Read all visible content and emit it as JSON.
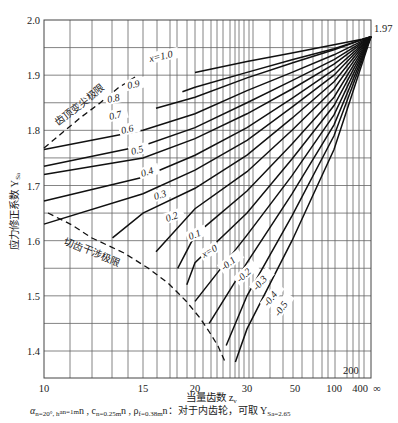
{
  "chart_data": {
    "type": "line",
    "title": "",
    "xlabel": "当量齿数 z_v",
    "ylabel": "应力修正系数 Y_Sa",
    "ylim": [
      1.35,
      2.0
    ],
    "x_scale": "nonlinear (≈1/z), ends at ∞",
    "x_ticks": [
      "10",
      "15",
      "20",
      "30",
      "50",
      "100",
      "400",
      "∞"
    ],
    "x_tick_extra": "200",
    "y_ticks": [
      "1.4",
      "1.5",
      "1.6",
      "1.7",
      "1.8",
      "1.9",
      "2.0"
    ],
    "grid": true,
    "convergence_point": {
      "x": "∞",
      "y": 1.97,
      "label": "1.97"
    },
    "series_param": "x (modification coefficient)",
    "series": [
      {
        "name": "x=1.0",
        "points": [
          [
            20,
            1.905
          ],
          [
            30,
            1.925
          ],
          [
            50,
            1.94
          ],
          [
            100,
            1.955
          ],
          [
            400,
            1.965
          ],
          [
            "∞",
            1.97
          ]
        ]
      },
      {
        "name": "0.9",
        "points": [
          [
            18.5,
            1.87
          ],
          [
            20,
            1.878
          ],
          [
            30,
            1.905
          ],
          [
            50,
            1.928
          ],
          [
            100,
            1.948
          ],
          [
            "∞",
            1.97
          ]
        ]
      },
      {
        "name": "0.8",
        "points": [
          [
            16,
            1.84
          ],
          [
            20,
            1.86
          ],
          [
            30,
            1.895
          ],
          [
            50,
            1.922
          ],
          [
            100,
            1.946
          ],
          [
            "∞",
            1.97
          ]
        ]
      },
      {
        "name": "0.7",
        "points": [
          [
            10,
            1.765
          ],
          [
            15,
            1.8
          ],
          [
            20,
            1.83
          ],
          [
            30,
            1.872
          ],
          [
            50,
            1.905
          ],
          [
            100,
            1.937
          ],
          [
            "∞",
            1.97
          ]
        ]
      },
      {
        "name": "0.6",
        "points": [
          [
            10,
            1.735
          ],
          [
            15,
            1.772
          ],
          [
            20,
            1.805
          ],
          [
            30,
            1.85
          ],
          [
            50,
            1.89
          ],
          [
            100,
            1.928
          ],
          [
            "∞",
            1.97
          ]
        ]
      },
      {
        "name": "0.5",
        "points": [
          [
            10,
            1.72
          ],
          [
            15,
            1.75
          ],
          [
            20,
            1.785
          ],
          [
            30,
            1.83
          ],
          [
            50,
            1.875
          ],
          [
            100,
            1.92
          ],
          [
            "∞",
            1.97
          ]
        ]
      },
      {
        "name": "0.4",
        "points": [
          [
            10,
            1.672
          ],
          [
            15,
            1.715
          ],
          [
            20,
            1.755
          ],
          [
            30,
            1.805
          ],
          [
            50,
            1.858
          ],
          [
            100,
            1.91
          ],
          [
            "∞",
            1.97
          ]
        ]
      },
      {
        "name": "0.3",
        "points": [
          [
            10,
            1.63
          ],
          [
            15,
            1.685
          ],
          [
            20,
            1.728
          ],
          [
            30,
            1.782
          ],
          [
            50,
            1.842
          ],
          [
            100,
            1.9
          ],
          [
            "∞",
            1.97
          ]
        ]
      },
      {
        "name": "0.2",
        "points": [
          [
            13,
            1.605
          ],
          [
            15,
            1.65
          ],
          [
            20,
            1.695
          ],
          [
            30,
            1.755
          ],
          [
            50,
            1.822
          ],
          [
            100,
            1.888
          ],
          [
            "∞",
            1.97
          ]
        ]
      },
      {
        "name": "0.1",
        "points": [
          [
            16,
            1.58
          ],
          [
            20,
            1.658
          ],
          [
            30,
            1.725
          ],
          [
            50,
            1.8
          ],
          [
            100,
            1.875
          ],
          [
            "∞",
            1.97
          ]
        ]
      },
      {
        "name": "x=0",
        "points": [
          [
            18,
            1.55
          ],
          [
            20,
            1.61
          ],
          [
            30,
            1.69
          ],
          [
            50,
            1.775
          ],
          [
            100,
            1.86
          ],
          [
            "∞",
            1.97
          ]
        ]
      },
      {
        "name": "-0.1",
        "points": [
          [
            19,
            1.52
          ],
          [
            20,
            1.56
          ],
          [
            30,
            1.65
          ],
          [
            50,
            1.748
          ],
          [
            100,
            1.845
          ],
          [
            "∞",
            1.97
          ]
        ]
      },
      {
        "name": "-0.2",
        "points": [
          [
            20,
            1.49
          ],
          [
            30,
            1.61
          ],
          [
            50,
            1.718
          ],
          [
            100,
            1.828
          ],
          [
            "∞",
            1.97
          ]
        ]
      },
      {
        "name": "-0.3",
        "points": [
          [
            22,
            1.45
          ],
          [
            30,
            1.56
          ],
          [
            50,
            1.685
          ],
          [
            100,
            1.81
          ],
          [
            "∞",
            1.97
          ]
        ]
      },
      {
        "name": "-0.4",
        "points": [
          [
            25,
            1.41
          ],
          [
            30,
            1.5
          ],
          [
            50,
            1.645
          ],
          [
            100,
            1.79
          ],
          [
            "∞",
            1.97
          ]
        ]
      },
      {
        "name": "-0.5",
        "points": [
          [
            27,
            1.38
          ],
          [
            30,
            1.44
          ],
          [
            50,
            1.6
          ],
          [
            100,
            1.765
          ],
          [
            "∞",
            1.97
          ]
        ]
      }
    ],
    "annotations": [
      {
        "text": "齿顶变尖极限",
        "type": "dashed boundary (upper left)"
      },
      {
        "text": "切齿干涉极限",
        "type": "dashed boundary (lower left)"
      }
    ],
    "footnote": "αn=20°, han=1mn, cn=0.25mn, ρf=0.38mn；对于内齿轮，可取 YSa=2.65"
  },
  "labels": {
    "y_axis": "应力修正系数 Y",
    "y_axis_sub": "Sa",
    "x_axis": "当量齿数 z",
    "x_axis_sub": "v",
    "value_197": "1.97",
    "annot_tip": "齿顶变尖极限",
    "annot_cut": "切齿干涉极限",
    "tick_200": "200",
    "footnote_a": "α",
    "footnote_text1": "n=20°, h",
    "footnote_text2": "an=1m",
    "footnote_text3": "n , c",
    "footnote_text4": "n=0.25m",
    "footnote_text5": "n , ρ",
    "footnote_text6": "f=0.38m",
    "footnote_text7": "n：对于内齿轮，可取 Y",
    "footnote_text8": "Sa=2.65"
  }
}
